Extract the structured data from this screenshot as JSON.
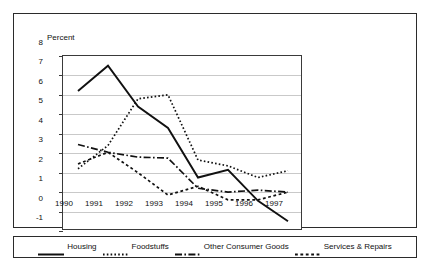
{
  "chart_data": {
    "type": "line",
    "title": "",
    "ylabel": "Percent",
    "xlabel": "",
    "ylim": [
      -1,
      8
    ],
    "yticks": [
      8,
      7,
      6,
      5,
      4,
      3,
      2,
      1,
      0,
      -1
    ],
    "ytick_labels": [
      "8",
      "7",
      "6",
      "5",
      "4",
      "3",
      "2",
      "1",
      "0",
      "-1"
    ],
    "grid": true,
    "legend_position": "bottom",
    "categories": [
      "1990",
      "1991",
      "1992",
      "1993",
      "1994",
      "1995",
      "1996",
      "1997"
    ],
    "x": [
      1990,
      1991,
      1992,
      1993,
      1994,
      1995,
      1996,
      1997
    ],
    "series": [
      {
        "name": "Housing",
        "style": "solid",
        "color": "#111111",
        "values": [
          6.2,
          7.5,
          5.4,
          4.3,
          1.75,
          2.15,
          0.55,
          -0.5
        ]
      },
      {
        "name": "Foodstuffs",
        "style": "fine-dotted",
        "color": "#111111",
        "values": [
          2.2,
          3.4,
          5.8,
          6.0,
          2.65,
          2.35,
          1.75,
          2.1
        ]
      },
      {
        "name": "Other Consumer Goods",
        "style": "dash-dot",
        "color": "#111111",
        "values": [
          3.45,
          3.05,
          2.8,
          2.75,
          1.2,
          1.0,
          1.1,
          1.0
        ]
      },
      {
        "name": "Services & Repairs",
        "style": "coarse-dotted",
        "color": "#111111",
        "values": [
          2.45,
          3.05,
          2.0,
          0.85,
          1.3,
          0.6,
          0.6,
          1.0
        ]
      }
    ]
  },
  "legend": {
    "entries": [
      {
        "label": "Housing"
      },
      {
        "label": "Foodstuffs"
      },
      {
        "label": "Other Consumer Goods"
      },
      {
        "label": "Services & Repairs"
      }
    ]
  }
}
